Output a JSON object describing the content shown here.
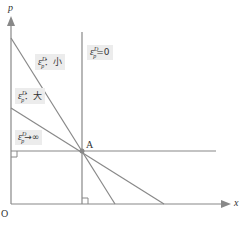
{
  "diagram": {
    "axes": {
      "y_label": "p",
      "x_label": "x",
      "origin_label": "O"
    },
    "point": {
      "label": "A"
    },
    "curves": [
      {
        "id": "vertical",
        "label_symbol": "ε",
        "label_sup": "D",
        "label_sub": "p",
        "label_rest": "=0"
      },
      {
        "id": "steep",
        "label_symbol": "ε",
        "label_sup": "D",
        "label_sub": "p",
        "label_rest": "：小"
      },
      {
        "id": "moderate",
        "label_symbol": "ε",
        "label_sup": "D",
        "label_sub": "p",
        "label_rest": "：大"
      },
      {
        "id": "horizontal",
        "label_symbol": "ε",
        "label_sup": "D",
        "label_sub": "p",
        "label_rest": "→∞"
      }
    ],
    "colors": {
      "line": "#888888",
      "axis": "#888888",
      "label_bg": "#ececec",
      "point": "#888888"
    }
  }
}
